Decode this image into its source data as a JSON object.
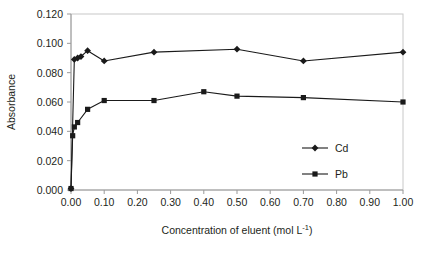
{
  "chart_data": {
    "type": "line",
    "title": "",
    "subtitle": "",
    "xlabel": "Concentration of eluent (mol L-1)",
    "xlabel_main": "Concentration of eluent (mol L",
    "xlabel_sup": "-1",
    "xlabel_tail": ")",
    "ylabel": "Absorbance",
    "xlim": [
      0.0,
      1.0
    ],
    "ylim": [
      0.0,
      0.12
    ],
    "grid": false,
    "legend_position": "inside-right-lower",
    "x_ticks": [
      "0.00",
      "0.10",
      "0.20",
      "0.30",
      "0.40",
      "0.50",
      "0.60",
      "0.70",
      "0.80",
      "0.90",
      "1.00"
    ],
    "x_tick_values": [
      0.0,
      0.1,
      0.2,
      0.3,
      0.4,
      0.5,
      0.6,
      0.7,
      0.8,
      0.9,
      1.0
    ],
    "y_ticks": [
      "0.000",
      "0.020",
      "0.040",
      "0.060",
      "0.080",
      "0.100",
      "0.120"
    ],
    "y_tick_values": [
      0.0,
      0.02,
      0.04,
      0.06,
      0.08,
      0.1,
      0.12
    ],
    "series": [
      {
        "name": "Cd",
        "marker": "diamond",
        "color": "#1a1a1a",
        "x": [
          0.0,
          0.01,
          0.02,
          0.03,
          0.05,
          0.1,
          0.25,
          0.5,
          0.7,
          1.0
        ],
        "y": [
          0.001,
          0.089,
          0.09,
          0.091,
          0.095,
          0.088,
          0.094,
          0.096,
          0.088,
          0.094
        ]
      },
      {
        "name": "Pb",
        "marker": "square",
        "color": "#1a1a1a",
        "x": [
          0.0,
          0.005,
          0.01,
          0.02,
          0.05,
          0.1,
          0.25,
          0.4,
          0.5,
          0.7,
          1.0
        ],
        "y": [
          0.001,
          0.037,
          0.043,
          0.046,
          0.055,
          0.061,
          0.061,
          0.067,
          0.064,
          0.063,
          0.06
        ]
      }
    ],
    "legend": [
      {
        "label": "Cd",
        "marker": "diamond"
      },
      {
        "label": "Pb",
        "marker": "square"
      }
    ]
  },
  "colors": {
    "frame": "#bfbfbf",
    "axis": "#808080",
    "line": "#1a1a1a",
    "text": "#231f20",
    "background": "#ffffff"
  }
}
